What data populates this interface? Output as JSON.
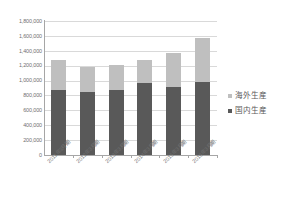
{
  "chart_data": {
    "type": "bar",
    "title": "",
    "xlabel": "",
    "ylabel": "",
    "ylim": [
      0,
      1800000
    ],
    "ytick_step": 200000,
    "yticks": [
      "1,800,000",
      "1,600,000",
      "1,400,000",
      "1,200,000",
      "1,000,000",
      "800,000",
      "600,000",
      "400,000",
      "200,000",
      "0"
    ],
    "ytick_values": [
      1800000,
      1600000,
      1400000,
      1200000,
      1000000,
      800000,
      600000,
      400000,
      200000,
      0
    ],
    "categories": [
      "2011年3月期",
      "2012年3月期",
      "2013年3月期",
      "2014年3月期",
      "2015年3月期",
      "2016年3月期"
    ],
    "stacked": true,
    "grid": true,
    "legend_position": "right",
    "series": [
      {
        "name": "国内生産",
        "color": "#595959",
        "values": [
          870000,
          845000,
          875000,
          970000,
          915000,
          980000
        ]
      },
      {
        "name": "海外生産",
        "color": "#bfbfbf",
        "values": [
          410000,
          335000,
          330000,
          310000,
          460000,
          590000
        ]
      }
    ],
    "totals": [
      1280000,
      1180000,
      1205000,
      1280000,
      1375000,
      1570000
    ]
  },
  "legend": {
    "items": [
      {
        "label": "海外生産",
        "color": "#bfbfbf"
      },
      {
        "label": "国内生産",
        "color": "#595959"
      }
    ]
  },
  "colors": {
    "overseas": "#bfbfbf",
    "domestic": "#595959",
    "grid": "#d9d9d9",
    "axis": "#a6a6a6",
    "tick_text": "#707070",
    "legend_text": "#595959",
    "background": "#ffffff"
  }
}
